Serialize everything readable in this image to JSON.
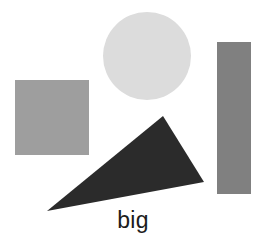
{
  "figure": {
    "width": 266,
    "height": 241,
    "background_color": "#ffffff",
    "caption": "big",
    "caption_color": "#1c1c1c"
  },
  "shapes": [
    {
      "id": "square",
      "name": "gray-square",
      "type": "rect",
      "label": "square",
      "color": "#9e9e9e",
      "x": 15,
      "y": 80,
      "width": 74,
      "height": 75
    },
    {
      "id": "circle",
      "name": "light-gray-circle",
      "type": "circle",
      "label": "circle",
      "color": "#dcdcdc",
      "cx": 147,
      "cy": 56,
      "r": 44
    },
    {
      "id": "bar",
      "name": "gray-vertical-rectangle",
      "type": "rect",
      "label": "rectangle",
      "color": "#808080",
      "x": 217,
      "y": 42,
      "width": 34,
      "height": 152
    },
    {
      "id": "triangle",
      "name": "dark-triangle",
      "type": "polygon",
      "label": "triangle",
      "color": "#2b2b2b",
      "points": "163,116 204,182 47,211"
    }
  ]
}
